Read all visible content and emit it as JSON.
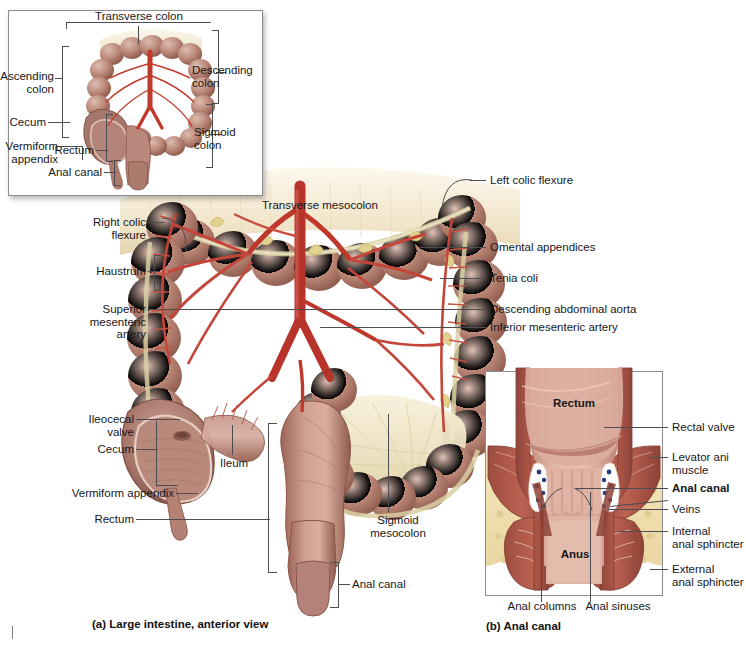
{
  "figure": {
    "panels": [
      {
        "id": "a",
        "caption": "(a) Large intestine, anterior view"
      },
      {
        "id": "b",
        "caption": "(b) Anal canal"
      }
    ]
  },
  "inset_orientation": {
    "name": "orientation-inset",
    "labels": {
      "transverse_colon": "Transverse colon",
      "ascending_colon": "Ascending\ncolon",
      "descending_colon": "Descending\ncolon",
      "cecum": "Cecum",
      "sigmoid_colon": "Sigmoid\ncolon",
      "vermiform_appendix": "Vermiform\nappendix",
      "rectum": "Rectum",
      "anal_canal": "Anal canal"
    }
  },
  "main_panel": {
    "caption": "(a) Large intestine, anterior view",
    "labels_left": [
      "Right colic\nflexure",
      "Haustrum",
      "Superior\nmesenteric\nartery",
      "Ileocecal\nvalve",
      "Cecum",
      "Vermiform appendix",
      "Rectum"
    ],
    "labels_right": [
      "Left colic flexure",
      "Omental appendices",
      "Tenia coli",
      "Descending abdominal aorta",
      "Inferior mesenteric artery"
    ],
    "labels_inner": [
      "Transverse mesocolon",
      "Ileum",
      "Sigmoid\nmesocolon",
      "Anal canal"
    ]
  },
  "anal_canal_panel": {
    "caption": "(b) Anal canal",
    "labels_interior": [
      "Rectum",
      "Anus"
    ],
    "labels_right": [
      "Rectal valve",
      "Levator ani\nmuscle",
      "Anal canal",
      "Veins",
      "Internal\nanal sphincter",
      "External\nanal sphincter"
    ],
    "labels_bottom": [
      "Anal columns",
      "Anal sinuses"
    ],
    "bold_labels": [
      "Rectum",
      "Anus",
      "Anal canal"
    ]
  },
  "colors": {
    "colon_mid": "#b1786c",
    "colon_light": "#cfa093",
    "colon_dark": "#8f5b51",
    "artery": "#c0392b",
    "artery_dark": "#a32b20",
    "mesentery": "#efe6cb",
    "tenia": "#d8cfa0",
    "fat": "#f0e2b8",
    "muscle": "#a6564a",
    "vein": "#2a3a7a",
    "mucosa": "#d8a899",
    "label_text": "#17171a",
    "leader_line": "#4c4c52",
    "frame_border": "#8b8b90",
    "background": "#ffffff"
  }
}
